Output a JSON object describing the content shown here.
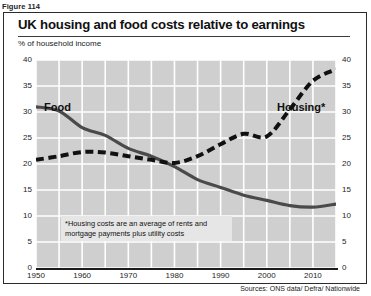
{
  "figure_caption": "Figure 114",
  "chart_data": {
    "type": "line",
    "title": "UK housing and food costs relative to earnings",
    "subtitle": "% of household income",
    "ylabel": "% of household income",
    "xlabel": "",
    "ylim": [
      0,
      40
    ],
    "xlim": [
      1950,
      2015
    ],
    "grid": true,
    "legend_position": "inline-labels",
    "yticks": [
      "0",
      "5",
      "10",
      "15",
      "20",
      "25",
      "30",
      "35",
      "40"
    ],
    "xticks": [
      "1950",
      "1960",
      "1970",
      "1980",
      "1990",
      "2000",
      "2010"
    ],
    "x": [
      1950,
      1955,
      1960,
      1965,
      1970,
      1975,
      1980,
      1985,
      1990,
      1995,
      2000,
      2005,
      2010,
      2015
    ],
    "series": [
      {
        "name": "Food",
        "style": "solid",
        "color": "#4a4a4a",
        "values": [
          31.0,
          30.2,
          27.0,
          25.5,
          23.0,
          21.5,
          19.5,
          17.0,
          15.5,
          14.0,
          13.0,
          12.0,
          11.7,
          12.3
        ]
      },
      {
        "name": "Housing*",
        "style": "dashed",
        "color": "#111111",
        "values": [
          20.8,
          21.5,
          22.3,
          22.2,
          21.5,
          20.8,
          20.2,
          21.5,
          23.8,
          25.8,
          25.3,
          30.5,
          36.0,
          38.2
        ]
      }
    ],
    "annotations": [
      "*Housing costs are an average of rents and mortgage payments plus utility costs"
    ],
    "source": "Sources: ONS data/ Defra/ Nationwide"
  },
  "labels": {
    "food": "Food",
    "housing": "Housing*"
  },
  "footnote": "*Housing costs are an average of rents and mortgage payments plus utility costs",
  "source": "Sources: ONS data/ Defra/ Nationwide"
}
